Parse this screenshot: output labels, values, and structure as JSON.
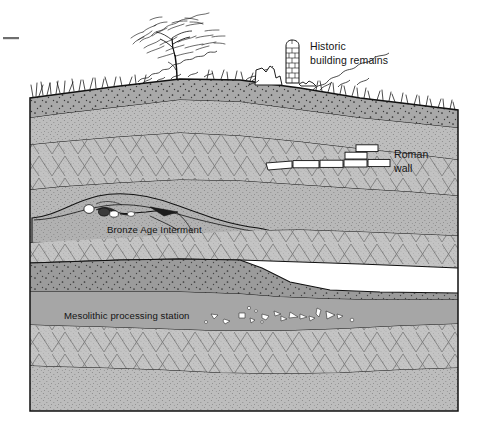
{
  "figure": {
    "type": "archaeological-stratigraphy-section",
    "title": "",
    "frame": {
      "x": 30,
      "y": 88,
      "width": 428,
      "height": 323
    },
    "tick_mark": {
      "present": true,
      "x": 3,
      "y": 38,
      "width": 16
    }
  },
  "labels": [
    {
      "id": "historic-building-remains",
      "lines": [
        "Historic",
        "building remains"
      ],
      "x": 310,
      "y": 48,
      "anchor": "start"
    },
    {
      "id": "roman-wall",
      "lines": [
        "Roman",
        "wall"
      ],
      "x": 394,
      "y": 155,
      "anchor": "start"
    },
    {
      "id": "bronze-age-interment",
      "lines": [
        "Bronze Age Interment"
      ],
      "x": 107,
      "y": 233,
      "anchor": "start"
    },
    {
      "id": "mesolithic-processing-station",
      "lines": [
        "Mesolithic processing station"
      ],
      "x": 64,
      "y": 319,
      "anchor": "start"
    }
  ],
  "features": [
    {
      "id": "tree",
      "name": "deciduous-tree",
      "x": 176,
      "y": 60
    },
    {
      "id": "grass",
      "name": "grass-tufts-ground-surface"
    },
    {
      "id": "scrub",
      "name": "low-scrub-vegetation"
    },
    {
      "id": "ruin-column",
      "name": "historic-stone-column-ruin",
      "x": 290,
      "y": 45
    },
    {
      "id": "ruin-wall-stub",
      "name": "historic-low-wall-stub",
      "x": 262,
      "y": 68
    },
    {
      "id": "roman-wall-blocks",
      "name": "roman-wall-masonry-course",
      "count": 9
    },
    {
      "id": "burial-skeleton",
      "name": "bronze-age-skeleton-in-grave-cut"
    },
    {
      "id": "grave-cut",
      "name": "bronze-age-grave-cut-mound"
    },
    {
      "id": "flint-scatter",
      "name": "mesolithic-flint-flake-scatter",
      "count": 18
    }
  ],
  "strata": [
    {
      "id": "s1",
      "name": "topsoil",
      "fill": "#a8a8a8",
      "texture": "coarse-dots"
    },
    {
      "id": "s2",
      "name": "subsoil-silt",
      "fill": "#bdbdbd",
      "texture": "fine-stipple"
    },
    {
      "id": "s3",
      "name": "gravel-with-cobbles",
      "fill": "#c2c2c2",
      "texture": "triangle-hatch"
    },
    {
      "id": "s4",
      "name": "roman-horizon-sand",
      "fill": "#b9b9b9",
      "texture": "fine-stipple"
    },
    {
      "id": "s5",
      "name": "buried-soil-bronze-age",
      "fill": "#b6b6b6",
      "texture": "fine-stipple"
    },
    {
      "id": "s6",
      "name": "gravel-band",
      "fill": "#c4c4c4",
      "texture": "triangle-hatch"
    },
    {
      "id": "s7",
      "name": "dark-organic-lens",
      "fill": "#9a9a9a",
      "texture": "coarse-dots"
    },
    {
      "id": "s8",
      "name": "mesolithic-occupation-band",
      "fill": "#a5a5a5",
      "texture": "plain"
    },
    {
      "id": "s9",
      "name": "lower-gravel",
      "fill": "#c4c4c4",
      "texture": "triangle-hatch"
    },
    {
      "id": "s10",
      "name": "basal-sand",
      "fill": "#bcbcbc",
      "texture": "fine-stipple"
    }
  ],
  "colors": {
    "line": "#111111",
    "white_feature": "#ffffff",
    "background": "#ffffff",
    "text": "#141414"
  }
}
